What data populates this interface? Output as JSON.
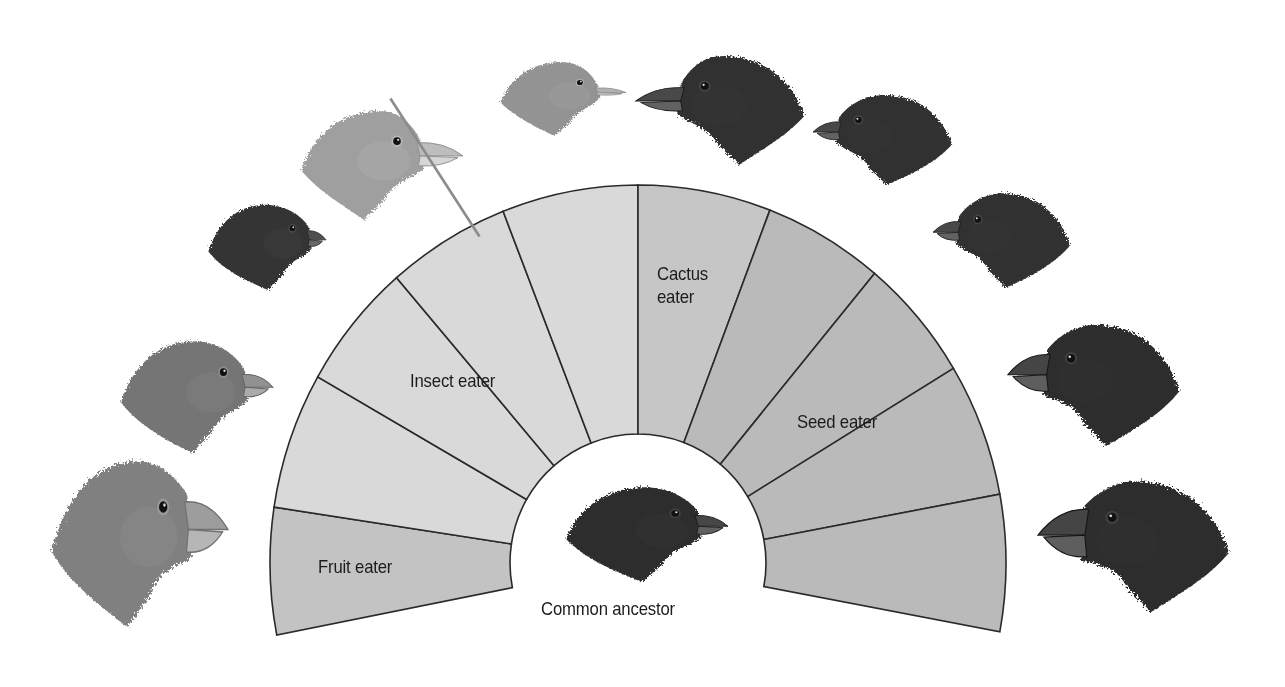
{
  "fan": {
    "center": [
      638,
      563
    ],
    "outer_radius": [
      368,
      378
    ],
    "inner_radius": [
      128,
      129
    ],
    "stroke_color": "#2a2a2a",
    "segments": [
      {
        "group": "fruit",
        "from": 191,
        "to": 171.5
      },
      {
        "group": "insect",
        "from": 171.5,
        "to": 150.5
      },
      {
        "group": "insect",
        "from": 150.5,
        "to": 131
      },
      {
        "group": "insect",
        "from": 131,
        "to": 111.5
      },
      {
        "group": "insect",
        "from": 111.5,
        "to": 90
      },
      {
        "group": "cactus",
        "from": 90,
        "to": 69
      },
      {
        "group": "seed",
        "from": 69,
        "to": 50
      },
      {
        "group": "seed",
        "from": 50,
        "to": 31
      },
      {
        "group": "seed",
        "from": 31,
        "to": 10.5
      },
      {
        "group": "seed",
        "from": 10.5,
        "to": -10.5
      }
    ],
    "group_colors": {
      "fruit": "#c3c3c3",
      "insect": "#d9d9d9",
      "cactus": "#c6c6c6",
      "seed": "#bababa"
    }
  },
  "labels": {
    "fruit": {
      "text": "Fruit eater",
      "x": 318,
      "y": 555
    },
    "insect": {
      "text": "Insect eater",
      "x": 410,
      "y": 369
    },
    "cactus": {
      "line1": "Cactus",
      "line2": "eater",
      "x": 657,
      "y": 262
    },
    "seed": {
      "text": "Seed eater",
      "x": 797,
      "y": 410
    },
    "ancestor": {
      "text": "Common ancestor",
      "x": 541,
      "y": 597
    }
  },
  "birds": [
    {
      "id": "fruit-finch-1",
      "x": 48,
      "y": 452,
      "w": 180,
      "h": 175,
      "facing": "right",
      "tone": "#7a7a7a",
      "beak": "large"
    },
    {
      "id": "fruit-finch-2",
      "x": 118,
      "y": 335,
      "w": 155,
      "h": 118,
      "facing": "right",
      "tone": "#6e6e6e",
      "beak": "medium"
    },
    {
      "id": "insect-finch-1",
      "x": 206,
      "y": 200,
      "w": 120,
      "h": 90,
      "facing": "right",
      "tone": "#2c2c2c",
      "beak": "small"
    },
    {
      "id": "insect-finch-2-tool-using",
      "x": 298,
      "y": 105,
      "w": 165,
      "h": 115,
      "facing": "right",
      "tone": "#9a9a9a",
      "beak": "long",
      "tool": true
    },
    {
      "id": "insect-finch-3",
      "x": 498,
      "y": 58,
      "w": 128,
      "h": 78,
      "facing": "right",
      "tone": "#8e8e8e",
      "beak": "thin"
    },
    {
      "id": "cactus-finch",
      "x": 636,
      "y": 50,
      "w": 172,
      "h": 115,
      "facing": "left",
      "tone": "#262626",
      "beak": "long"
    },
    {
      "id": "seed-finch-1",
      "x": 813,
      "y": 90,
      "w": 142,
      "h": 95,
      "facing": "left",
      "tone": "#262626",
      "beak": "medium"
    },
    {
      "id": "seed-finch-2",
      "x": 933,
      "y": 188,
      "w": 140,
      "h": 100,
      "facing": "left",
      "tone": "#262626",
      "beak": "medium"
    },
    {
      "id": "seed-finch-3",
      "x": 1008,
      "y": 318,
      "w": 175,
      "h": 128,
      "facing": "left",
      "tone": "#222222",
      "beak": "large"
    },
    {
      "id": "seed-finch-4",
      "x": 1038,
      "y": 474,
      "w": 195,
      "h": 138,
      "facing": "left",
      "tone": "#222222",
      "beak": "xlarge"
    }
  ],
  "ancestor_bird": {
    "id": "common-ancestor-finch",
    "x": 563,
    "y": 482,
    "w": 165,
    "h": 100,
    "facing": "right",
    "tone": "#242424",
    "beak": "medium"
  }
}
